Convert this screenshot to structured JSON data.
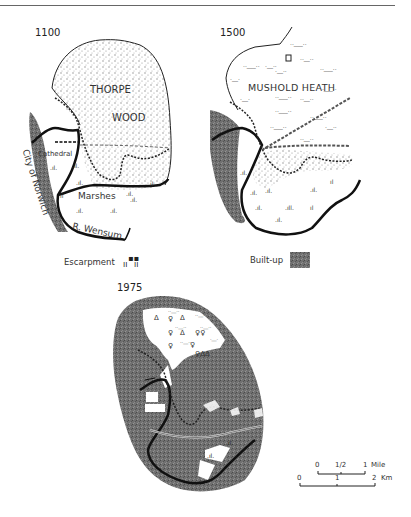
{
  "figure": {
    "maps": [
      {
        "year": "1100",
        "labels": {
          "wood_line1": "THORPE",
          "wood_line2": "WOOD",
          "cathedral": "Cathedral",
          "marshes": "Marshes",
          "city": "City of Norwich",
          "river": "R. Wensum"
        }
      },
      {
        "year": "1500",
        "labels": {
          "heath": "MUSHOLD HEATH"
        }
      },
      {
        "year": "1975",
        "labels": {}
      }
    ],
    "legend": {
      "escarpment_label": "Escarpment",
      "builtup_label": "Built-up",
      "builtup_color": "#6e6e6e"
    },
    "scale": {
      "miles": {
        "ticks": [
          "0",
          "1/2",
          "1"
        ],
        "unit": "Mile"
      },
      "km": {
        "ticks": [
          "0",
          "1",
          "2"
        ],
        "unit": "Km"
      }
    },
    "colors": {
      "ink": "#1e1e1e",
      "builtup": "#6e6e6e",
      "wood_stipple": "#9a9a9a",
      "paper": "#ffffff"
    }
  }
}
